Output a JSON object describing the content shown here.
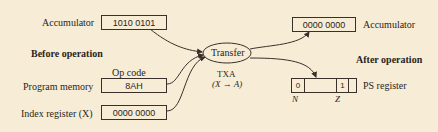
{
  "before": {
    "heading": "Before operation",
    "accumulator": {
      "label": "Accumulator",
      "value": "1010 0101"
    },
    "program_memory": {
      "label": "Program memory",
      "header": "Op code",
      "value": "8AH"
    },
    "index_register": {
      "label": "Index register (X)",
      "value": "0000 0000"
    }
  },
  "operation": {
    "label": "Transfer",
    "mnemonic": "TXA",
    "description": "(X → A)"
  },
  "after": {
    "heading": "After operation",
    "accumulator": {
      "label": "Accumulator",
      "value": "0000 0000"
    },
    "ps_register": {
      "label": "PS register",
      "cells": [
        "0",
        "",
        "1",
        ""
      ],
      "flags": [
        "N",
        "Z"
      ]
    }
  },
  "colors": {
    "background": "#f7edd6",
    "ink": "#3a302a"
  }
}
